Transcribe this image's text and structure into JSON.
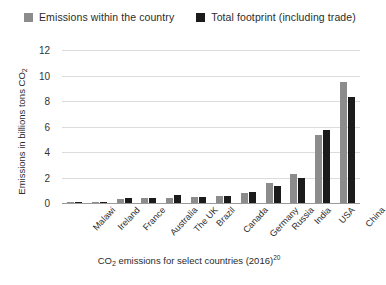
{
  "legend": {
    "entries": [
      {
        "label": "Emissions within the country",
        "color": "#8c8c8c",
        "swatch": "grey"
      },
      {
        "label": "Total footprint (including trade)",
        "color": "#1b1b1b",
        "swatch": "black"
      }
    ]
  },
  "axis": {
    "y_title_main": "Emissions in billions tons CO",
    "y_title_sub": "2",
    "y_ticks": [
      "12",
      "10",
      "8",
      "6",
      "4",
      "2",
      "0"
    ]
  },
  "caption": {
    "prefix": "CO",
    "sub": "2",
    "main": " emissions for select countries (2016)",
    "footnote": "20"
  },
  "colors": {
    "within_country": "#8c8c8c",
    "total_footprint": "#1b1b1b",
    "gridline": "#dcdcdc",
    "axis": "#9a9a9a",
    "background": "#ffffff",
    "text": "#2b2b2b"
  },
  "chart_data": {
    "type": "bar",
    "title": "CO2 emissions for select countries (2016)",
    "xlabel": "",
    "ylabel": "Emissions in billions tons CO2",
    "ylim": [
      0,
      12
    ],
    "yticks": [
      0,
      2,
      4,
      6,
      8,
      10,
      12
    ],
    "grid": true,
    "legend_position": "top",
    "categories": [
      "Malawi",
      "Ireland",
      "France",
      "Australia",
      "The UK",
      "Brazil",
      "Canada",
      "Germany",
      "Russia",
      "India",
      "USA",
      "China"
    ],
    "series": [
      {
        "name": "Emissions within the country",
        "color": "#8c8c8c",
        "values": [
          0.01,
          0.04,
          0.33,
          0.4,
          0.4,
          0.45,
          0.55,
          0.8,
          1.6,
          2.3,
          5.3,
          9.5
        ]
      },
      {
        "name": "Total footprint (including trade)",
        "color": "#1b1b1b",
        "values": [
          0.01,
          0.05,
          0.43,
          0.42,
          0.62,
          0.5,
          0.58,
          0.9,
          1.35,
          2.0,
          5.7,
          8.3
        ]
      }
    ]
  }
}
